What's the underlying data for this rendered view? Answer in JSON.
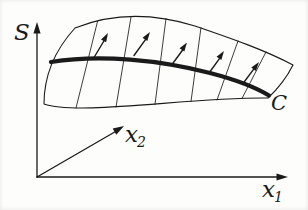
{
  "figure": {
    "colors": {
      "background": "#fdfdfb",
      "ink": "#1a1a1a"
    },
    "labels": {
      "surface": "S",
      "curve": "C",
      "axis1": {
        "base": "x",
        "sub": "1"
      },
      "axis2": {
        "base": "x",
        "sub": "2"
      }
    }
  }
}
